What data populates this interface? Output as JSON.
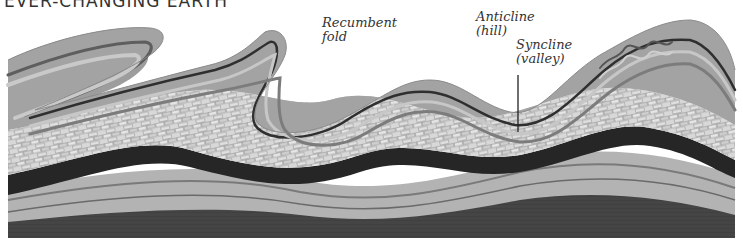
{
  "heading": {
    "text": "EVER-CHANGING EARTH"
  },
  "labels": {
    "recumbent": {
      "line1": "Recumbent",
      "line2": "fold"
    },
    "anticline": {
      "line1": "Anticline",
      "line2": "(hill)"
    },
    "syncline": {
      "line1": "Syncline",
      "line2": "(valley)"
    }
  },
  "colors": {
    "background": "#ffffff",
    "surface": "#a9a9a9",
    "band_light": "#c4c4c4",
    "band_mid": "#8e8e8e",
    "band_dark": "#3a3a3a",
    "limestone": "#d6d6d6",
    "coal": "#262626",
    "base": "#4a4a4a",
    "text": "#333333"
  }
}
